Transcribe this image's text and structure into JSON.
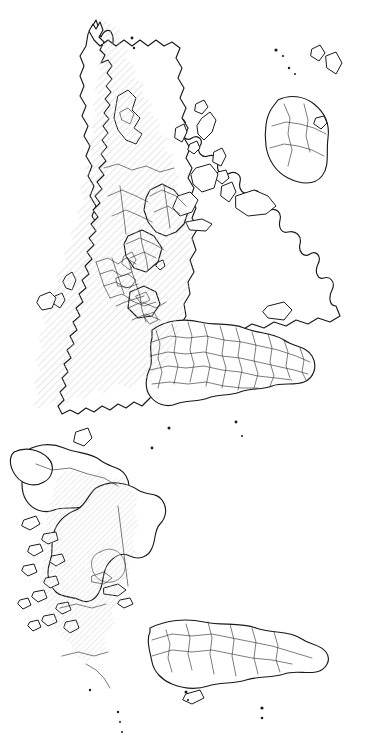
{
  "map": {
    "title": "World Map",
    "projection": "equirectangular-rotated-90ccw",
    "orientation_degrees": -90,
    "canvas": {
      "width": 369,
      "height": 750
    },
    "background_color": "#ffffff",
    "coastline_color": "#1a1a1a",
    "border_color": "#2b2b2b",
    "highlight_pattern": "diagonal-hatch",
    "highlight_color": "#c9c9c9",
    "highlight_fill_opacity": "0.55",
    "legend_present": false,
    "labels_present": false,
    "graticule_present": false,
    "highlighted_regions": [
      {
        "name": "Russia",
        "pattern": "diagonal-hatch"
      },
      {
        "name": "Canada",
        "pattern": "diagonal-hatch"
      }
    ],
    "landmasses": [
      {
        "name": "Eurasia"
      },
      {
        "name": "Africa"
      },
      {
        "name": "Australia"
      },
      {
        "name": "North America"
      },
      {
        "name": "South America"
      },
      {
        "name": "Greenland"
      },
      {
        "name": "Antarctica-edge"
      },
      {
        "name": "Indonesia-archipelago"
      },
      {
        "name": "Japan"
      },
      {
        "name": "Philippines"
      },
      {
        "name": "New Zealand"
      },
      {
        "name": "Madagascar"
      },
      {
        "name": "British Isles"
      },
      {
        "name": "Iceland"
      },
      {
        "name": "Caribbean islands"
      }
    ]
  }
}
